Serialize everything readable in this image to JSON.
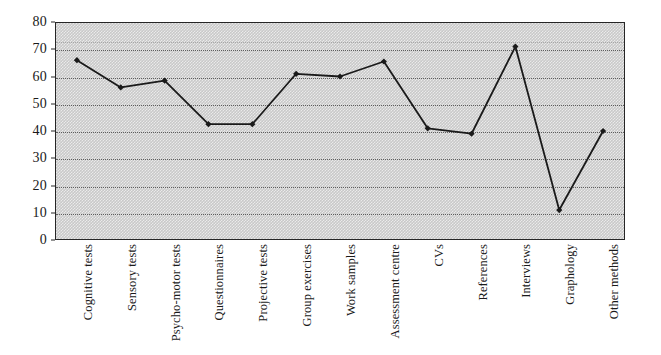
{
  "chart_data": {
    "type": "line",
    "title": "",
    "subtitle": "",
    "xlabel": "",
    "ylabel": "",
    "ylim": [
      0,
      80
    ],
    "yticks": [
      0,
      10,
      20,
      30,
      40,
      50,
      60,
      70,
      80
    ],
    "grid": true,
    "legend": "none",
    "marker": "filled-diamond",
    "line_color": "#1a1a1a",
    "plot_background": "#c9c9c9",
    "categories": [
      "Cognitive tests",
      "Sensory tests",
      "Psycho-motor tests",
      "Questionnaires",
      "Projective tests",
      "Group exercises",
      "Work samples",
      "Assessment centre",
      "CVs",
      "References",
      "Interviews",
      "Graphology",
      "Other methods"
    ],
    "values": [
      66,
      56,
      58.5,
      42.5,
      42.5,
      61,
      60,
      65.5,
      41,
      39,
      71,
      11,
      40
    ]
  }
}
